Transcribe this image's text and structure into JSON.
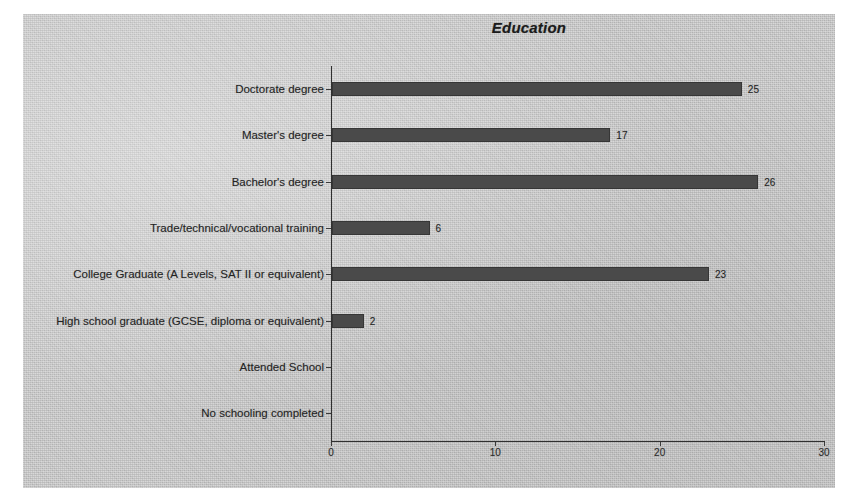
{
  "chart_data": {
    "type": "bar",
    "orientation": "horizontal",
    "title": "Education",
    "xlabel": "",
    "ylabel": "",
    "xlim": [
      0,
      30
    ],
    "xticks": [
      0,
      10,
      20,
      30
    ],
    "xtick_labels": [
      "0",
      "10",
      "20",
      "30"
    ],
    "grid": false,
    "legend": null,
    "bar_color": "#4a4a4a",
    "background_color": "#c6c6c6",
    "categories": [
      "Doctorate degree",
      "Master's degree",
      "Bachelor's degree",
      "Trade/technical/vocational training",
      "College Graduate (A Levels, SAT II or equivalent)",
      "High school graduate (GCSE, diploma or equivalent)",
      "Attended School",
      "No schooling completed"
    ],
    "values": [
      25,
      17,
      26,
      6,
      23,
      2,
      0,
      0
    ],
    "value_labels": [
      "25",
      "17",
      "26",
      "6",
      "23",
      "2",
      "",
      ""
    ]
  }
}
